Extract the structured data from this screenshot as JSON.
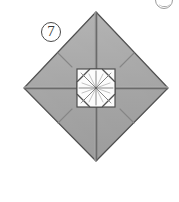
{
  "figure": {
    "kind": "origami-fold-diagram",
    "step_number": "⑧",
    "step_number_plain": "7",
    "caption": "",
    "colors": {
      "paper_fill": "#a9a9a9",
      "paper_fill_light": "#b4b4b4",
      "paper_fill_dark": "#9c9c9c",
      "outline": "#4a4a4a",
      "fold_line": "#5a5a5a",
      "crease_hint": "#8c8c8c",
      "center_white": "#fbfbfb",
      "background": "#ffffff",
      "label_text": "#3a3a3a"
    },
    "geometry": {
      "diamond_top": [
        96,
        12
      ],
      "diamond_left": [
        24,
        88
      ],
      "diamond_right": [
        168,
        88
      ],
      "diamond_bottom": [
        96,
        161
      ],
      "center": [
        96,
        88
      ],
      "center_square_size": 38,
      "inner_octagon_radius": 14
    },
    "parts": [
      {
        "name": "outer-diamond",
        "label": "folded paper square rotated 45°"
      },
      {
        "name": "vertical-fold-line",
        "label": "vertical center crease"
      },
      {
        "name": "horizontal-fold-line",
        "label": "horizontal center crease"
      },
      {
        "name": "quadrant-crease-upper-left",
        "label": "short diagonal crease mark"
      },
      {
        "name": "quadrant-crease-upper-right",
        "label": "short diagonal crease mark"
      },
      {
        "name": "quadrant-crease-lower-left",
        "label": "short diagonal crease mark"
      },
      {
        "name": "quadrant-crease-lower-right",
        "label": "short diagonal crease mark"
      },
      {
        "name": "center-square",
        "label": "white square formed by folded flaps"
      },
      {
        "name": "center-octagon",
        "label": "inner white octagon"
      },
      {
        "name": "center-starburst",
        "label": "radiating crease lines at center"
      }
    ],
    "corner_marker": {
      "name": "clipped-step-marker",
      "label": "partially visible circled marker from adjacent figure"
    }
  }
}
